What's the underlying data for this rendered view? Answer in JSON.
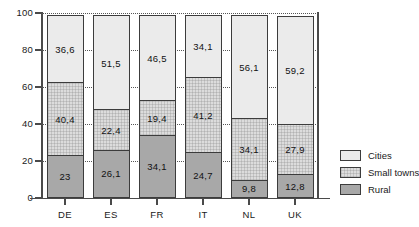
{
  "chart_data": {
    "type": "bar",
    "stacked": true,
    "title": "",
    "subtitle": "",
    "xlabel": "",
    "ylabel": "",
    "ylim": [
      0,
      100
    ],
    "yticks": [
      0,
      20,
      40,
      60,
      80,
      100
    ],
    "ytick_labels": [
      "0",
      "20",
      "40",
      "60",
      "80",
      "100"
    ],
    "grid": "horizontal-dotted",
    "legend_position": "right",
    "categories": [
      "DE",
      "ES",
      "FR",
      "IT",
      "NL",
      "UK"
    ],
    "series": [
      {
        "name": "Rural",
        "color": "#a8a8a8",
        "values": [
          23.0,
          26.1,
          34.1,
          24.7,
          9.8,
          12.8
        ],
        "labels": [
          "23",
          "26,1",
          "34,1",
          "24,7",
          "9,8",
          "12,8"
        ]
      },
      {
        "name": "Small towns",
        "color": "#dcdcdc",
        "values": [
          40.4,
          22.4,
          19.4,
          41.2,
          34.1,
          27.9
        ],
        "labels": [
          "40,4",
          "22,4",
          "19,4",
          "41,2",
          "34,1",
          "27,9"
        ]
      },
      {
        "name": "Cities",
        "color": "#ebebeb",
        "values": [
          36.6,
          51.5,
          46.5,
          34.1,
          56.1,
          59.2
        ],
        "labels": [
          "36,6",
          "51,5",
          "46,5",
          "34,1",
          "56,1",
          "59,2"
        ]
      }
    ]
  },
  "legend": {
    "items": [
      {
        "label": "Cities",
        "key": "cities"
      },
      {
        "label": "Small towns",
        "key": "towns"
      },
      {
        "label": "Rural",
        "key": "rural"
      }
    ]
  }
}
